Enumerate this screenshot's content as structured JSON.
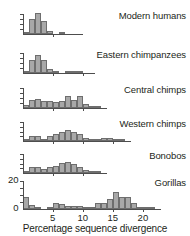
{
  "chart_data": {
    "type": "bar",
    "title": "",
    "xlabel": "Percentage sequence divergence",
    "ylabel": "",
    "xlim": [
      0,
      22.5
    ],
    "ylim": [
      0,
      22
    ],
    "grid": false,
    "legend": "none",
    "x_ticks": [
      5,
      10,
      15,
      20
    ],
    "x_tick_labels": [
      "5",
      "10",
      "15",
      "20"
    ],
    "bottom_panel_y_ticks": [
      0,
      20
    ],
    "bottom_panel_y_tick_labels": [
      "0",
      "20"
    ],
    "bin_width": 1,
    "panels": [
      {
        "label": "Modern humans",
        "y_axis_labeled": false,
        "bin_starts": [
          0,
          1,
          2,
          3,
          4,
          5,
          6,
          7,
          8
        ],
        "values": [
          2,
          14,
          20,
          12,
          2.5,
          0,
          0.8,
          0,
          0
        ]
      },
      {
        "label": "Eastern chimpanzees",
        "y_axis_labeled": false,
        "bin_starts": [
          0,
          1,
          2,
          3,
          4,
          5,
          6,
          7,
          8,
          9,
          10
        ],
        "values": [
          1.5,
          12,
          17,
          12,
          4,
          1.5,
          0,
          2,
          1,
          0.5,
          0
        ]
      },
      {
        "label": "Central chimps",
        "y_axis_labeled": false,
        "bin_starts": [
          0,
          1,
          2,
          3,
          4,
          5,
          6,
          7,
          8,
          9,
          10,
          11,
          12
        ],
        "values": [
          3,
          7,
          8,
          6,
          6,
          5.5,
          6,
          11,
          7,
          10.5,
          4,
          1,
          0.5
        ]
      },
      {
        "label": "Western chimps",
        "y_axis_labeled": false,
        "bin_starts": [
          0,
          1,
          2,
          3,
          4,
          5,
          6,
          7,
          8,
          9,
          10,
          11,
          12,
          13,
          14,
          15,
          16
        ],
        "values": [
          2,
          5,
          5,
          2,
          5,
          7,
          10,
          12,
          10,
          7,
          3,
          2,
          2,
          3,
          3,
          1.5,
          0.5
        ]
      },
      {
        "label": "Bonobos",
        "y_axis_labeled": false,
        "bin_starts": [
          0,
          1,
          2,
          3,
          4,
          5,
          6,
          7,
          8,
          9,
          10,
          11,
          12
        ],
        "values": [
          2,
          6,
          6,
          4,
          6,
          7,
          11,
          12,
          9,
          6,
          3,
          2,
          0.5
        ]
      },
      {
        "label": "Gorillas",
        "y_axis_labeled": true,
        "bin_starts": [
          0,
          1,
          2,
          3,
          4,
          5,
          6,
          7,
          8,
          9,
          10,
          11,
          12,
          13,
          14,
          15,
          16,
          17,
          18,
          19,
          20,
          21
        ],
        "values": [
          9,
          3,
          0.5,
          0,
          1,
          5,
          4,
          2.5,
          2,
          2,
          1,
          0.5,
          5,
          5,
          8,
          13,
          9.5,
          9,
          5,
          1.5,
          1,
          1.5
        ]
      }
    ]
  },
  "axis": {
    "x_label_text": "Percentage sequence divergence"
  }
}
